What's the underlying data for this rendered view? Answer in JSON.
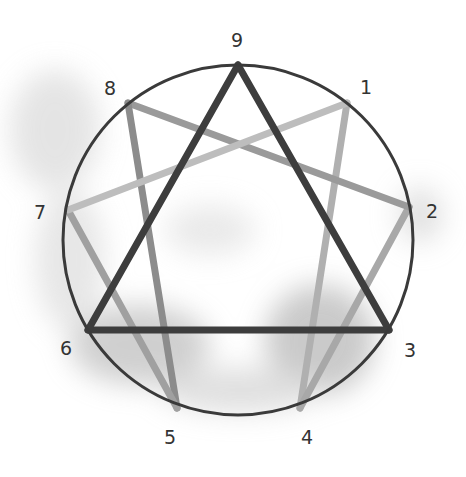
{
  "diagram": {
    "type": "enneagram",
    "circle": {
      "cx": 238,
      "cy": 240,
      "r": 175,
      "stroke": "#3a3a3a"
    },
    "points": [
      {
        "label": "9",
        "x": 238,
        "y": 65,
        "lx": 237,
        "ly": 40
      },
      {
        "label": "1",
        "x": 347,
        "y": 103,
        "lx": 366,
        "ly": 87
      },
      {
        "label": "2",
        "x": 409,
        "y": 207,
        "lx": 432,
        "ly": 211
      },
      {
        "label": "3",
        "x": 389,
        "y": 330,
        "lx": 410,
        "ly": 350
      },
      {
        "label": "4",
        "x": 300,
        "y": 408,
        "lx": 307,
        "ly": 437
      },
      {
        "label": "5",
        "x": 177,
        "y": 408,
        "lx": 170,
        "ly": 437
      },
      {
        "label": "6",
        "x": 88,
        "y": 330,
        "lx": 66,
        "ly": 348
      },
      {
        "label": "7",
        "x": 68,
        "y": 210,
        "lx": 40,
        "ly": 212
      },
      {
        "label": "8",
        "x": 128,
        "y": 103,
        "lx": 110,
        "ly": 88
      }
    ],
    "triangle": {
      "order": [
        "9",
        "3",
        "6"
      ],
      "color": "#3d3d3d"
    },
    "hexad": {
      "segments": [
        {
          "from": "1",
          "to": "4",
          "color": "#b0b0b0"
        },
        {
          "from": "4",
          "to": "2",
          "color": "#a8a8a8"
        },
        {
          "from": "2",
          "to": "8",
          "color": "#9a9a9a"
        },
        {
          "from": "8",
          "to": "5",
          "color": "#8c8c8c"
        },
        {
          "from": "5",
          "to": "7",
          "color": "#a0a0a0"
        },
        {
          "from": "7",
          "to": "1",
          "color": "#bdbdbd"
        }
      ]
    }
  }
}
